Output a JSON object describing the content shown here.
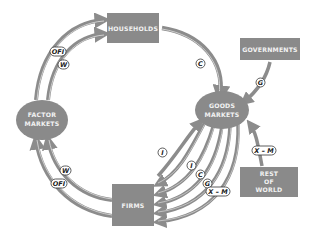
{
  "diagram": {
    "nodes": {
      "households": "HOUSEHOLDS",
      "factor_markets_1": "FACTOR",
      "factor_markets_2": "MARKETS",
      "goods_markets_1": "GOODS",
      "goods_markets_2": "MARKETS",
      "firms": "FIRMS",
      "governments": "GOVERNMENTS",
      "rest_of_world_1": "REST",
      "rest_of_world_2": "OF",
      "rest_of_world_3": "WORLD"
    },
    "flow_labels": {
      "ofi_top": "OFI",
      "w_top": "W",
      "c_top": "C",
      "g_gov": "G",
      "w_bottom": "W",
      "ofi_bottom": "OFI",
      "i_outer": "I",
      "i_inner": "I",
      "c_bottom": "C",
      "g_bottom": "G",
      "xm_bottom": "X – M",
      "xm_row": "X – M"
    },
    "colors": {
      "node_fill": "#8a8a8a",
      "arrow": "#8c8c8c",
      "arrow_highlight": "#c8c8c8",
      "background": "#ffffff"
    }
  }
}
